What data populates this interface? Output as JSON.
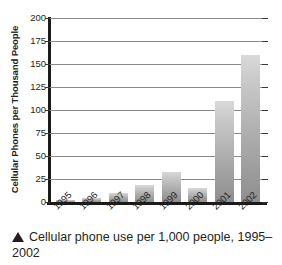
{
  "chart_data": {
    "type": "bar",
    "title": "",
    "xlabel": "",
    "ylabel": "Cellular Phones per Thousand People",
    "categories": [
      "1995",
      "1996",
      "1997",
      "1998",
      "1999",
      "2000",
      "2001",
      "2002"
    ],
    "values": [
      2,
      4,
      10,
      18,
      33,
      15,
      110,
      160
    ],
    "ylim": [
      0,
      200
    ],
    "yticks": [
      0,
      25,
      50,
      75,
      100,
      125,
      150,
      175,
      200
    ],
    "ytick_labels": [
      "0",
      "25",
      "50",
      "75",
      "100",
      "125",
      "150",
      "175",
      "200"
    ],
    "grid": true,
    "legend": "none",
    "bar_color_top": "#d9d9d9",
    "bar_color_bottom": "#8e8e8e",
    "axis_color": "#1a1a1a",
    "gridline_color": "#8a8a8a"
  },
  "caption": {
    "marker": "up-triangle",
    "text": "Cellular phone use per 1,000 people, 1995–2002"
  }
}
